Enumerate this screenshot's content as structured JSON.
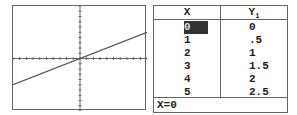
{
  "graph": {
    "function": "Y1 = 0.5X",
    "window": {
      "xmin": -10,
      "xmax": 10,
      "ymin": -10,
      "ymax": 10,
      "xscl": 1,
      "yscl": 1
    },
    "line_color": "#555555"
  },
  "table": {
    "headers": [
      "X",
      "Y1"
    ],
    "rows": [
      {
        "x": "0",
        "y": "0"
      },
      {
        "x": "1",
        "y": ".5"
      },
      {
        "x": "2",
        "y": "1"
      },
      {
        "x": "3",
        "y": "1.5"
      },
      {
        "x": "4",
        "y": "2"
      },
      {
        "x": "5",
        "y": "2.5"
      }
    ],
    "selected_row": 0,
    "footer": "X=0"
  },
  "chart_data": {
    "type": "line",
    "title": "",
    "xlabel": "X",
    "ylabel": "Y1",
    "x": [
      0,
      1,
      2,
      3,
      4,
      5
    ],
    "series": [
      {
        "name": "Y1",
        "values": [
          0,
          0.5,
          1,
          1.5,
          2,
          2.5
        ]
      }
    ],
    "xlim": [
      -10,
      10
    ],
    "ylim": [
      -10,
      10
    ],
    "grid": false
  }
}
